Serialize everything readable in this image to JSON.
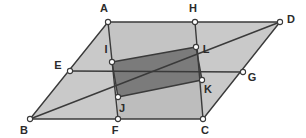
{
  "figure": {
    "background_color": "#ffffff",
    "stroke_color": "#3a3a3a",
    "fill_light": "#c9c9c9",
    "fill_mid": "#bdbdbd",
    "fill_dark": "#7b7b7b",
    "vertex_fill": "#ffffff",
    "vertex_stroke": "#3a3a3a",
    "label_color": "#2b2b2b"
  },
  "points": {
    "A": {
      "label": "A",
      "x": 108,
      "y": 22,
      "label_x": 104,
      "label_y": 9
    },
    "B": {
      "label": "B",
      "x": 30,
      "y": 119,
      "label_x": 24,
      "label_y": 131
    },
    "C": {
      "label": "C",
      "x": 203,
      "y": 119,
      "label_x": 205,
      "label_y": 131
    },
    "D": {
      "label": "D",
      "x": 280,
      "y": 22,
      "label_x": 291,
      "label_y": 20
    },
    "E": {
      "label": "E",
      "x": 70,
      "y": 71,
      "label_x": 58,
      "label_y": 66
    },
    "F": {
      "label": "F",
      "x": 118,
      "y": 119,
      "label_x": 115,
      "label_y": 131
    },
    "G": {
      "label": "G",
      "x": 243,
      "y": 72,
      "label_x": 252,
      "label_y": 78
    },
    "H": {
      "label": "H",
      "x": 195,
      "y": 22,
      "label_x": 193,
      "label_y": 9
    },
    "I": {
      "label": "I",
      "x": 112,
      "y": 62,
      "label_x": 106,
      "label_y": 50
    },
    "J": {
      "label": "J",
      "x": 118,
      "y": 97,
      "label_x": 122,
      "label_y": 109
    },
    "K": {
      "label": "K",
      "x": 202,
      "y": 80,
      "label_x": 208,
      "label_y": 90
    },
    "L": {
      "label": "L",
      "x": 196,
      "y": 47,
      "label_x": 206,
      "label_y": 50
    }
  },
  "regions": [
    {
      "name": "outer-parallelogram",
      "vertices": [
        "A",
        "D",
        "C",
        "B"
      ],
      "fill": "#c9c9c9"
    },
    {
      "name": "upper-band-AHLI",
      "vertices": [
        "A",
        "H",
        "L",
        "I"
      ],
      "fill": "#c4c4c4"
    },
    {
      "name": "lower-band-JKCF",
      "vertices": [
        "J",
        "K",
        "C",
        "F"
      ],
      "fill": "#bdbdbd"
    },
    {
      "name": "inner-quadrilateral-ILKJ",
      "vertices": [
        "I",
        "L",
        "K",
        "J"
      ],
      "fill": "#7b7b7b"
    }
  ],
  "segments": [
    {
      "name": "side-AD",
      "from": "A",
      "to": "D"
    },
    {
      "name": "side-DC",
      "from": "D",
      "to": "C"
    },
    {
      "name": "side-CB",
      "from": "C",
      "to": "B"
    },
    {
      "name": "side-BA",
      "from": "B",
      "to": "A"
    },
    {
      "name": "segment-EG",
      "from": "E",
      "to": "G"
    },
    {
      "name": "segment-BD",
      "from": "B",
      "to": "D"
    },
    {
      "name": "segment-AF",
      "from": "A",
      "to": "F"
    },
    {
      "name": "segment-HC",
      "from": "H",
      "to": "C"
    },
    {
      "name": "segment-IL",
      "from": "I",
      "to": "L"
    },
    {
      "name": "segment-LK",
      "from": "L",
      "to": "K"
    },
    {
      "name": "segment-KJ",
      "from": "K",
      "to": "J"
    },
    {
      "name": "segment-JI",
      "from": "J",
      "to": "I"
    }
  ],
  "vertex_order": [
    "A",
    "B",
    "C",
    "D",
    "E",
    "F",
    "G",
    "H",
    "I",
    "J",
    "K",
    "L"
  ]
}
